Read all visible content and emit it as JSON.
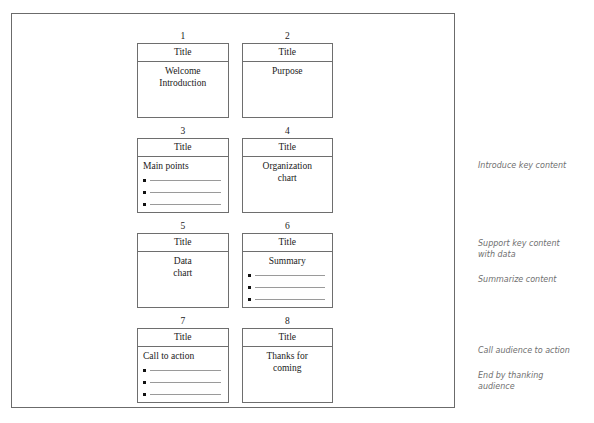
{
  "document": {
    "type": "presentation-storyboard",
    "frame_border_color": "#6b6b6b",
    "slide_border_color": "#6e6e6e",
    "annotation_color": "#6f6f6f"
  },
  "slides": [
    {
      "number": "1",
      "title": "Title",
      "body_text": "Welcome\nIntroduction",
      "body_align": "center",
      "bullets": 0
    },
    {
      "number": "2",
      "title": "Title",
      "body_text": "Purpose",
      "body_align": "center",
      "bullets": 0
    },
    {
      "number": "3",
      "title": "Title",
      "body_text": "Main points",
      "body_align": "left",
      "bullets": 3
    },
    {
      "number": "4",
      "title": "Title",
      "body_text": "Organization\nchart",
      "body_align": "center",
      "bullets": 0
    },
    {
      "number": "5",
      "title": "Title",
      "body_text": "Data\nchart",
      "body_align": "center",
      "bullets": 0
    },
    {
      "number": "6",
      "title": "Title",
      "body_text": "Summary",
      "body_align": "center",
      "bullets": 3
    },
    {
      "number": "7",
      "title": "Title",
      "body_text": "Call to action",
      "body_align": "left",
      "bullets": 3
    },
    {
      "number": "8",
      "title": "Title",
      "body_text": "Thanks for\ncoming",
      "body_align": "center",
      "bullets": 0
    }
  ],
  "annotations": [
    {
      "text": "Introduce key content",
      "top": 160
    },
    {
      "text": "Support key content\nwith data",
      "top": 238
    },
    {
      "text": "Summarize content",
      "top": 274
    },
    {
      "text": "Call audience to action",
      "top": 345
    },
    {
      "text": "End by thanking\naudience",
      "top": 370
    }
  ]
}
